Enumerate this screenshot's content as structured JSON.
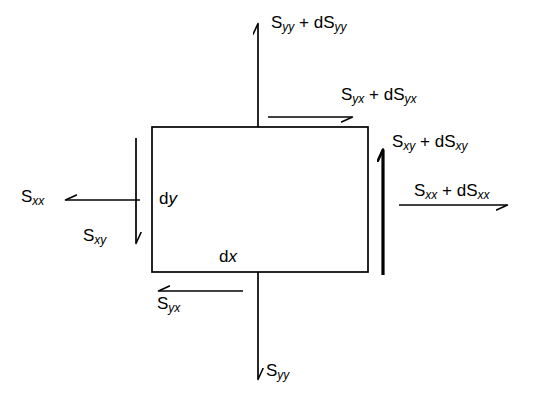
{
  "figure": {
    "type": "stress-element-diagram",
    "element": {
      "width_label": "dx",
      "height_label": "dy"
    }
  },
  "symbols": {
    "S": "S",
    "d": "d",
    "plus": "+"
  },
  "labels": {
    "top_normal": {
      "base": "S",
      "sub": "yy",
      "increment_base": "S",
      "increment_sub": "yy",
      "prefix": "d",
      "text": "Syy + dSyy"
    },
    "top_shear": {
      "base": "S",
      "sub": "yx",
      "increment_base": "S",
      "increment_sub": "yx",
      "prefix": "d",
      "text": "Syx + dSyx"
    },
    "right_shear": {
      "base": "S",
      "sub": "xy",
      "increment_base": "S",
      "increment_sub": "xy",
      "prefix": "d",
      "text": "Sxy + dSxy"
    },
    "right_normal": {
      "base": "S",
      "sub": "xx",
      "increment_base": "S",
      "increment_sub": "xx",
      "prefix": "d",
      "text": "Sxx + dSxx"
    },
    "left_normal": {
      "base": "S",
      "sub": "xx",
      "text": "Sxx"
    },
    "left_shear": {
      "base": "S",
      "sub": "xy",
      "text": "Sxy"
    },
    "bottom_shear": {
      "base": "S",
      "sub": "yx",
      "text": "Syx"
    },
    "bottom_normal": {
      "base": "S",
      "sub": "yy",
      "text": "Syy"
    },
    "width_dim": {
      "prefix": "d",
      "axis": "x",
      "text": "dx"
    },
    "height_dim": {
      "prefix": "d",
      "axis": "y",
      "text": "dy"
    }
  },
  "colors": {
    "stroke": "#000000",
    "background": "#ffffff"
  }
}
